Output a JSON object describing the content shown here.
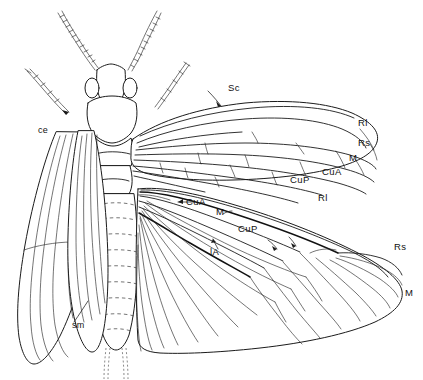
{
  "figure": {
    "background_color": "#ffffff",
    "line_color": "#1b1b1b",
    "width": 423,
    "height": 380
  },
  "labels": {
    "sc": "Sc",
    "r1_forewing": "Rl",
    "rs_forewing": "Rs",
    "m_forewing": "M",
    "cua_forewing": "CuA",
    "cup_forewing": "CuP",
    "cua_hindwing": "CuA",
    "m_hindwing": "M",
    "cup_hindwing": "CuP",
    "a1_hindwing": "lA",
    "r1_hindwing": "Rl",
    "rs_hindwing": "Rs",
    "m_hindwing_apex": "M",
    "ce": "ce",
    "sm": "sm"
  },
  "parts": {
    "antenna_left": "left antenna",
    "antenna_right": "right antenna",
    "palp_left": "left maxillary palp",
    "palp_right": "right maxillary palp",
    "head": "head",
    "eye_left": "left compound eye",
    "eye_right": "right compound eye",
    "pronotum": "pronotum",
    "thorax": "thorax",
    "abdomen": "abdomen",
    "cercus_left": "left cercus",
    "cercus_right": "right cercus",
    "forewing_right": "right forewing",
    "hindwing_right": "right hindwing",
    "wings_left": "left wings folded over body"
  }
}
